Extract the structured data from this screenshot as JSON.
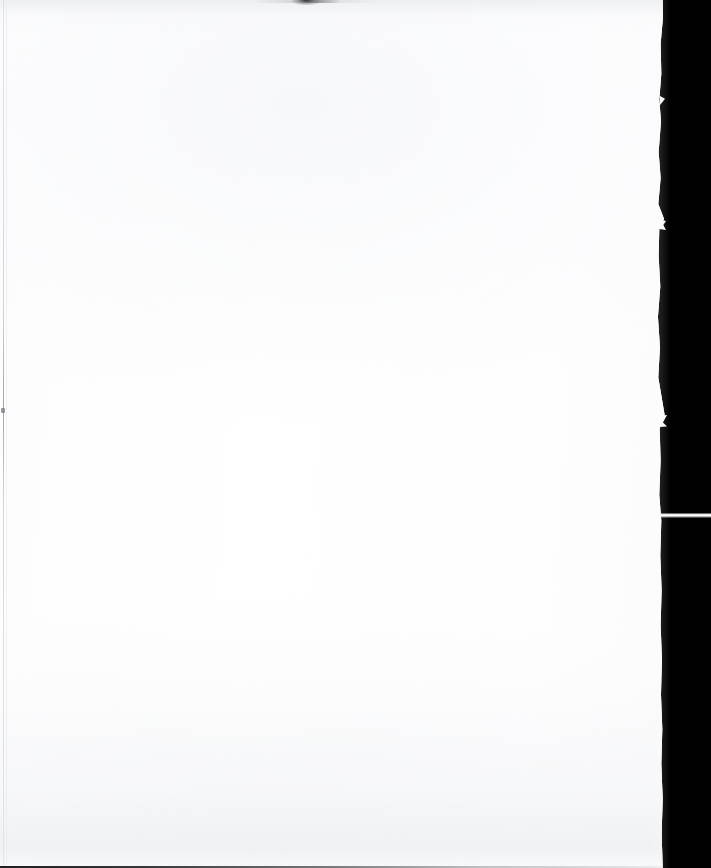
{
  "document": {
    "kind": "scanned-page",
    "title": "Scanned Blank Page",
    "page_text": "",
    "page_body_text": "",
    "header_text": "",
    "footer_text": "",
    "page_number": "",
    "caption": "",
    "annotation": "",
    "content_summary": "Blank scanned sheet — no printed text, figures, or rules visible.",
    "visible_text_items": []
  },
  "canvas": {
    "width_px": 711,
    "height_px": 868
  },
  "colors": {
    "paper": "#fefeff",
    "paper_warm_shade": "#f4f5f7",
    "scanner_void": "#010101",
    "edge_rule_gray": "#c4c8cd",
    "smudge_dark": "#282a2e",
    "bottom_line": "#141416",
    "streak_white": "#ffffff"
  },
  "regions": {
    "paper_sheet": {
      "name": "paper-sheet",
      "left_px": 0,
      "top_px": 0,
      "width_px": 668,
      "height_px": 868,
      "description": "Blank off-white scanned sheet occupying the left portion of the frame"
    },
    "scanner_void": {
      "name": "scanner-void",
      "left_px": 663,
      "top_px": 0,
      "width_px": 48,
      "height_px": 868,
      "description": "Solid black area to the right of the page edge where the scanner lid shows through"
    }
  },
  "artifacts": {
    "right_edge": {
      "label": "torn-curled-right-edge",
      "approx_x_px": 662,
      "description": "Irregular torn paper edge separating sheet from black void"
    },
    "edge_notches": [
      {
        "label": "notch-upper",
        "x_px": 662,
        "y_px": 100
      },
      {
        "label": "notch-mid",
        "x_px": 662,
        "y_px": 224
      },
      {
        "label": "notch-lower",
        "x_px": 662,
        "y_px": 420
      }
    ],
    "void_streak": {
      "label": "horizontal-light-streak",
      "x_px": 655,
      "y_px": 515,
      "width_px": 56,
      "height_px": 5,
      "description": "Bright thin horizontal line crossing the black void"
    },
    "left_rule": {
      "label": "faint-vertical-scan-line",
      "x_px": 3,
      "description": "Faint gray vertical line running the full page height near the left margin"
    },
    "left_speck": {
      "label": "dark-speck",
      "x_px": 2,
      "y_px": 410
    },
    "top_smudge": {
      "label": "dark-smudge",
      "x_px": 300,
      "y_px": 1,
      "description": "Small dark mark at the very top edge of the scan"
    },
    "bottom_line": {
      "label": "bottom-edge-line",
      "y_px": 866,
      "description": "Thin dark line along the bottom border of the scan"
    },
    "shading": {
      "label": "uneven-scan-illumination",
      "description": "Subtle gray gradients at top and bottom from scanner lighting and page curl"
    }
  }
}
